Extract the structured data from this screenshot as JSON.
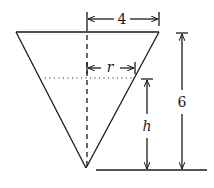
{
  "diagram": {
    "labels": {
      "top_radius": "4",
      "water_radius": "r",
      "water_height": "h",
      "total_height": "6"
    },
    "stroke_color": "#1a1a1a",
    "background_color": "#ffffff"
  }
}
